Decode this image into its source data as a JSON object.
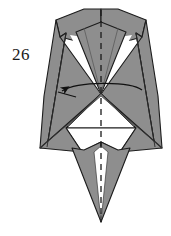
{
  "diagram": {
    "step_number": "26",
    "type": "origami-fold-step",
    "canvas": {
      "width": 171,
      "height": 236
    },
    "colors": {
      "background": "#ffffff",
      "paper_front": "#8e8e8e",
      "paper_front_light": "#9a9a9a",
      "paper_front_dark": "#7c7c7c",
      "paper_back": "#ffffff",
      "outline": "#1c1c1c",
      "crease_line": "#2a2a2a",
      "center_fold_dash": "#1a1a1a",
      "arrow": "#111111"
    },
    "center_fold": {
      "label": "vertical center fold line",
      "style": "dashed",
      "x": 101,
      "y_start": 10,
      "y_end": 222
    },
    "arrow": {
      "label": "fold-left arrow",
      "direction": "left",
      "head_x": 58,
      "head_y": 92,
      "tail_x": 142,
      "tail_y": 90
    },
    "regions": [
      {
        "name": "upper-left-shoulder-flap",
        "fill": "paper_front"
      },
      {
        "name": "upper-right-shoulder-flap",
        "fill": "paper_front"
      },
      {
        "name": "left-body-panel",
        "fill": "paper_front"
      },
      {
        "name": "right-body-panel",
        "fill": "paper_front"
      },
      {
        "name": "center-upper-spike",
        "fill": "paper_front"
      },
      {
        "name": "center-white-triangle",
        "fill": "paper_back"
      },
      {
        "name": "lower-left-wing",
        "fill": "paper_front"
      },
      {
        "name": "lower-right-wing",
        "fill": "paper_front"
      },
      {
        "name": "bottom-left-leg",
        "fill": "paper_front"
      },
      {
        "name": "bottom-right-leg",
        "fill": "paper_front"
      }
    ]
  }
}
